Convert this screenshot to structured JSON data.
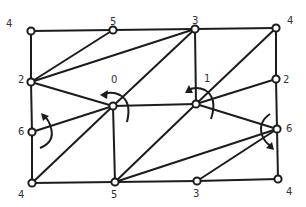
{
  "diagram": {
    "title": "",
    "nodes": [
      {
        "id": "tl",
        "label": "4",
        "x": 31,
        "y": 31,
        "lx": 6,
        "ly": 27
      },
      {
        "id": "t5",
        "label": "5",
        "x": 113,
        "y": 30,
        "lx": 110,
        "ly": 25
      },
      {
        "id": "t3",
        "label": "3",
        "x": 195,
        "y": 29,
        "lx": 192,
        "ly": 24
      },
      {
        "id": "tr",
        "label": "4",
        "x": 276,
        "y": 28,
        "lx": 287,
        "ly": 24
      },
      {
        "id": "l2",
        "label": "2",
        "x": 31,
        "y": 82,
        "lx": 18,
        "ly": 83
      },
      {
        "id": "r2",
        "label": "2",
        "x": 276,
        "y": 79,
        "lx": 283,
        "ly": 83
      },
      {
        "id": "c0",
        "label": "0",
        "x": 113,
        "y": 106,
        "lx": 111,
        "ly": 83
      },
      {
        "id": "c1",
        "label": "1",
        "x": 196,
        "y": 104,
        "lx": 204,
        "ly": 82
      },
      {
        "id": "l6",
        "label": "6",
        "x": 32,
        "y": 132,
        "lx": 18,
        "ly": 135
      },
      {
        "id": "r6",
        "label": "6",
        "x": 277,
        "y": 129,
        "lx": 286,
        "ly": 132
      },
      {
        "id": "bl",
        "label": "4",
        "x": 32,
        "y": 183,
        "lx": 18,
        "ly": 198
      },
      {
        "id": "b5",
        "label": "5",
        "x": 115,
        "y": 182,
        "lx": 111,
        "ly": 198
      },
      {
        "id": "b3",
        "label": "3",
        "x": 197,
        "y": 181,
        "lx": 193,
        "ly": 197
      },
      {
        "id": "br",
        "label": "4",
        "x": 278,
        "y": 179,
        "lx": 286,
        "ly": 195
      }
    ],
    "edges": [
      [
        "tl",
        "t5"
      ],
      [
        "t5",
        "t3"
      ],
      [
        "t3",
        "tr"
      ],
      [
        "tl",
        "l2"
      ],
      [
        "l2",
        "l6"
      ],
      [
        "l6",
        "bl"
      ],
      [
        "tr",
        "r2"
      ],
      [
        "r2",
        "r6"
      ],
      [
        "r6",
        "br"
      ],
      [
        "bl",
        "b5"
      ],
      [
        "b5",
        "b3"
      ],
      [
        "b3",
        "br"
      ],
      [
        "l2",
        "t5"
      ],
      [
        "l2",
        "t3"
      ],
      [
        "l2",
        "c0"
      ],
      [
        "c0",
        "t3"
      ],
      [
        "c0",
        "l6"
      ],
      [
        "c0",
        "bl"
      ],
      [
        "c0",
        "b5"
      ],
      [
        "c0",
        "c1"
      ],
      [
        "c1",
        "t3"
      ],
      [
        "c1",
        "tr"
      ],
      [
        "c1",
        "r2"
      ],
      [
        "c1",
        "r6"
      ],
      [
        "c1",
        "b5"
      ],
      [
        "b5",
        "r6"
      ],
      [
        "b3",
        "r6"
      ]
    ],
    "rotations": [
      {
        "id": "rot-0",
        "center": "c0",
        "direction": "counterclockwise"
      },
      {
        "id": "rot-1",
        "center": "c1",
        "direction": "counterclockwise"
      },
      {
        "id": "rot-l6",
        "center": "l6",
        "direction": "counterclockwise"
      },
      {
        "id": "rot-r6",
        "center": "r6",
        "direction": "clockwise"
      }
    ],
    "colors": {
      "stroke": "#1c1c1c",
      "label": "#333333",
      "background": "#ffffff"
    }
  }
}
